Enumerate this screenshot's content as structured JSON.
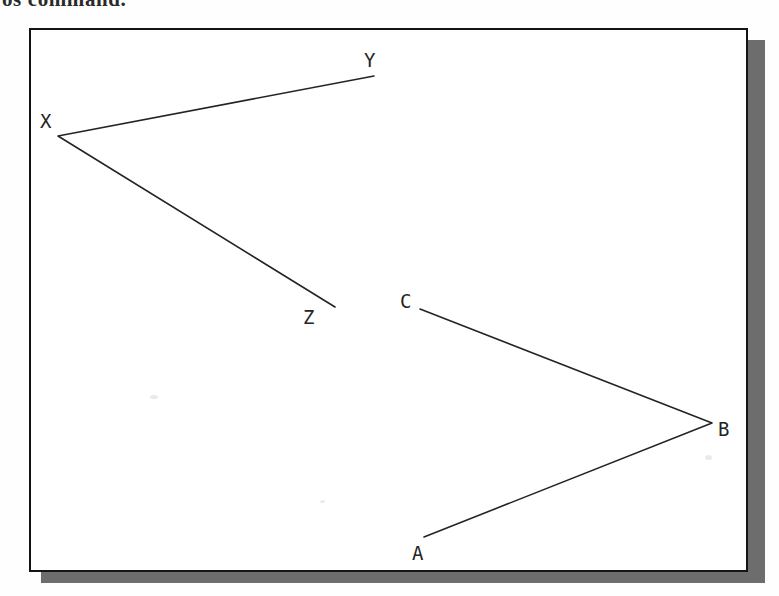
{
  "caption": {
    "text": "os command."
  },
  "figure": {
    "box": {
      "x": 29,
      "y": 28,
      "width": 719,
      "height": 544,
      "border_color": "#141414",
      "fill_color": "#ffffff",
      "shadow_color": "#595959"
    },
    "stroke_color": "#242424",
    "stroke_width": 1.6,
    "label_color": "#242424",
    "polylines": [
      {
        "name": "polyline-xyz",
        "points": [
          {
            "label": "Y",
            "x": 374,
            "y": 76
          },
          {
            "label": "X",
            "x": 58,
            "y": 136
          },
          {
            "label": "Z",
            "x": 335,
            "y": 307
          }
        ]
      },
      {
        "name": "polyline-abc",
        "points": [
          {
            "label": "C",
            "x": 420,
            "y": 309
          },
          {
            "label": "B",
            "x": 712,
            "y": 423
          },
          {
            "label": "A",
            "x": 424,
            "y": 537
          }
        ]
      }
    ],
    "labels": [
      {
        "text": "Y",
        "x": 364,
        "y": 51
      },
      {
        "text": "X",
        "x": 40,
        "y": 112
      },
      {
        "text": "Z",
        "x": 303,
        "y": 308
      },
      {
        "text": "C",
        "x": 400,
        "y": 292
      },
      {
        "text": "B",
        "x": 718,
        "y": 420
      },
      {
        "text": "A",
        "x": 412,
        "y": 544
      }
    ]
  }
}
